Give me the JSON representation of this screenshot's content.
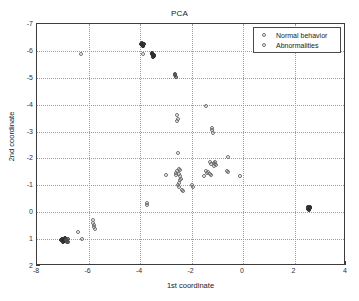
{
  "chart_data": {
    "type": "scatter",
    "title": "PCA",
    "xlabel": "1st coordinate",
    "ylabel": "2nd coordinate",
    "xlim": [
      -8,
      4
    ],
    "ylim": [
      -7,
      2
    ],
    "y_axis_inverted": true,
    "xticks": [
      -8,
      -6,
      -4,
      -2,
      0,
      2,
      4
    ],
    "xtick_labels": [
      "-8",
      "-6",
      "-4",
      "-2",
      "0",
      "2",
      "4"
    ],
    "yticks": [
      -7,
      -6,
      -5,
      -4,
      -3,
      -2,
      -1,
      0,
      1,
      2
    ],
    "ytick_labels": [
      "-7",
      "-6",
      "-5",
      "-4",
      "-3",
      "-2",
      "-1",
      "0",
      "1",
      "2"
    ],
    "grid": true,
    "grid_style": "dotted",
    "legend_position": "top-right",
    "legend": [
      {
        "label": "Normal behavior",
        "marker": "circle",
        "color": "#6f6f6f"
      },
      {
        "label": "Abnormalities",
        "marker": "circle",
        "color": "#6f6f6f"
      }
    ],
    "series": [
      {
        "name": "Normal behavior",
        "marker": "circle",
        "points": [
          [
            -6.98,
            1.02,
            "dense"
          ],
          [
            -7.03,
            0.98,
            "dense"
          ],
          [
            -6.93,
            1.06,
            "dense"
          ],
          [
            -7.06,
            1.05,
            "dense"
          ],
          [
            -6.9,
            0.96,
            "dense"
          ],
          [
            -7.0,
            1.1,
            "dense"
          ],
          [
            -6.88,
            1.02,
            "mid"
          ],
          [
            -6.82,
            1.04,
            "mid"
          ],
          [
            -6.79,
            0.99,
            "mid"
          ],
          [
            -6.84,
            1.09,
            "mid"
          ],
          [
            -6.78,
            1.12,
            "mid"
          ],
          [
            -3.92,
            -6.22,
            "dense"
          ],
          [
            -3.96,
            -6.25,
            "dense"
          ],
          [
            -3.88,
            -6.2,
            "dense"
          ],
          [
            -3.9,
            -6.17,
            "dense"
          ],
          [
            -3.94,
            -6.3,
            "dense"
          ],
          [
            -3.86,
            -6.27,
            "dense"
          ],
          [
            -3.5,
            -5.84,
            "dense"
          ],
          [
            -3.54,
            -5.88,
            "dense"
          ],
          [
            -3.46,
            -5.82,
            "dense"
          ],
          [
            -3.48,
            -5.79,
            "dense"
          ],
          [
            -3.53,
            -5.92,
            "dense"
          ],
          [
            -3.44,
            -5.86,
            "dense"
          ],
          [
            2.56,
            -0.15,
            "dense"
          ],
          [
            2.6,
            -0.18,
            "dense"
          ],
          [
            2.52,
            -0.12,
            "dense"
          ],
          [
            2.58,
            -0.1,
            "dense"
          ],
          [
            2.54,
            -0.2,
            "dense"
          ],
          [
            2.62,
            -0.14,
            "dense"
          ],
          [
            -2.64,
            -5.1,
            "mid"
          ],
          [
            -2.62,
            -5.03,
            "mid"
          ],
          [
            -2.66,
            -5.14,
            "mid"
          ]
        ]
      },
      {
        "name": "Abnormalities",
        "marker": "circle",
        "points": [
          [
            -6.42,
            0.75,
            "open"
          ],
          [
            -6.25,
            1.0,
            "open"
          ],
          [
            -5.82,
            0.3,
            "open"
          ],
          [
            -5.78,
            0.47,
            "open"
          ],
          [
            -5.8,
            0.55,
            "open"
          ],
          [
            -5.76,
            0.62,
            "open"
          ],
          [
            -5.84,
            0.39,
            "open"
          ],
          [
            -6.3,
            -5.87,
            "open"
          ],
          [
            -3.88,
            -5.87,
            "open"
          ],
          [
            -3.74,
            -0.36,
            "open"
          ],
          [
            -3.72,
            -0.27,
            "open"
          ],
          [
            -2.98,
            -1.38,
            "open"
          ],
          [
            -2.6,
            -1.45,
            "open"
          ],
          [
            -2.58,
            -1.52,
            "open"
          ],
          [
            -2.62,
            -1.38,
            "open"
          ],
          [
            -2.5,
            -1.6,
            "open"
          ],
          [
            -2.46,
            -1.58,
            "open"
          ],
          [
            -2.48,
            -1.42,
            "open"
          ],
          [
            -2.44,
            -1.36,
            "open"
          ],
          [
            -2.5,
            -1.1,
            "open"
          ],
          [
            -2.52,
            -1.02,
            "open"
          ],
          [
            -2.48,
            -0.95,
            "open"
          ],
          [
            -2.46,
            -1.18,
            "open"
          ],
          [
            -2.42,
            -1.25,
            "open"
          ],
          [
            -2.38,
            -0.82,
            "open"
          ],
          [
            -2.34,
            -0.78,
            "open"
          ],
          [
            -2.52,
            -2.2,
            "open"
          ],
          [
            -2.55,
            -3.62,
            "open"
          ],
          [
            -2.54,
            -3.48,
            "open"
          ],
          [
            -2.56,
            -3.4,
            "open"
          ],
          [
            -2.0,
            -1.0,
            "open"
          ],
          [
            -1.95,
            -0.95,
            "open"
          ],
          [
            -1.42,
            -3.95,
            "open"
          ],
          [
            -1.2,
            -3.05,
            "open"
          ],
          [
            -1.18,
            -2.95,
            "open"
          ],
          [
            -1.22,
            -3.12,
            "open"
          ],
          [
            -1.3,
            -1.88,
            "open"
          ],
          [
            -1.26,
            -1.8,
            "open"
          ],
          [
            -1.14,
            -1.82,
            "open"
          ],
          [
            -1.1,
            -1.78,
            "open"
          ],
          [
            -1.08,
            -1.85,
            "open"
          ],
          [
            -1.12,
            -1.72,
            "open"
          ],
          [
            -1.05,
            -1.75,
            "open"
          ],
          [
            -1.44,
            -1.52,
            "open"
          ],
          [
            -1.4,
            -1.45,
            "open"
          ],
          [
            -1.36,
            -1.5,
            "open"
          ],
          [
            -1.3,
            -1.42,
            "open"
          ],
          [
            -1.25,
            -1.38,
            "open"
          ],
          [
            -1.52,
            -1.36,
            "open"
          ],
          [
            -0.58,
            -2.04,
            "open"
          ],
          [
            -0.62,
            -1.55,
            "open"
          ],
          [
            -0.58,
            -1.48,
            "open"
          ],
          [
            -0.12,
            -1.36,
            "open"
          ]
        ]
      }
    ]
  }
}
